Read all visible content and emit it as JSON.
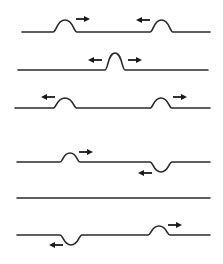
{
  "diagram": {
    "title": "",
    "colors": {
      "line": "#2a2a2a",
      "arrow": "#1a1a1a",
      "background": "#ffffff"
    },
    "frames": [
      {
        "id": "frame-1",
        "baseline_y": 32,
        "x_start": 22,
        "x_end": 210,
        "pulses": [
          {
            "x0": 53,
            "x1": 77,
            "amp": -12,
            "arrow": {
              "dir": "right",
              "x": 76,
              "y": 19
            }
          },
          {
            "x0": 150,
            "x1": 173,
            "amp": -12,
            "arrow": {
              "dir": "left",
              "x": 150,
              "y": 20
            }
          }
        ]
      },
      {
        "id": "frame-2",
        "baseline_y": 70,
        "x_start": 18,
        "x_end": 208,
        "pulses": [
          {
            "x0": 105,
            "x1": 125,
            "amp": -17,
            "arrows": [
              {
                "dir": "left",
                "x": 102,
                "y": 60
              },
              {
                "dir": "right",
                "x": 128,
                "y": 60
              }
            ]
          }
        ]
      },
      {
        "id": "frame-3",
        "baseline_y": 108,
        "x_start": 15,
        "x_end": 210,
        "pulses": [
          {
            "x0": 53,
            "x1": 77,
            "amp": -10,
            "arrow": {
              "dir": "left",
              "x": 55,
              "y": 97
            }
          },
          {
            "x0": 150,
            "x1": 172,
            "amp": -10,
            "arrow": {
              "dir": "right",
              "x": 173,
              "y": 97
            }
          }
        ]
      },
      {
        "id": "frame-4",
        "baseline_y": 162,
        "x_start": 17,
        "x_end": 210,
        "pulses": [
          {
            "x0": 60,
            "x1": 80,
            "amp": -9,
            "arrow": {
              "dir": "right",
              "x": 79,
              "y": 152
            }
          },
          {
            "x0": 150,
            "x1": 172,
            "amp": 10,
            "arrow": {
              "dir": "left",
              "x": 152,
              "y": 173
            }
          }
        ]
      },
      {
        "id": "frame-5",
        "baseline_y": 198,
        "x_start": 17,
        "x_end": 210,
        "pulses": []
      },
      {
        "id": "frame-6",
        "baseline_y": 235,
        "x_start": 17,
        "x_end": 210,
        "pulses": [
          {
            "x0": 60,
            "x1": 82,
            "amp": 10,
            "arrow": {
              "dir": "left",
              "x": 63,
              "y": 245
            }
          },
          {
            "x0": 148,
            "x1": 170,
            "amp": -9,
            "arrow": {
              "dir": "right",
              "x": 168,
              "y": 225
            }
          }
        ]
      }
    ]
  }
}
